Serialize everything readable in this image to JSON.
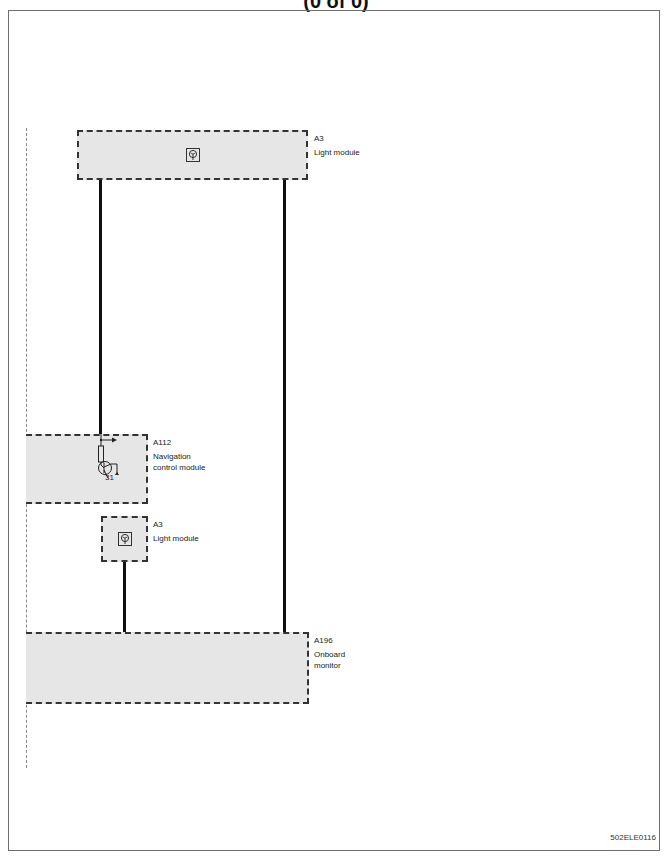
{
  "header": {
    "title": "(0 of 0)"
  },
  "modules": [
    {
      "id": "A3",
      "name": "Light module",
      "position": "top"
    },
    {
      "id": "A112",
      "name_line1": "Navigation",
      "name_line2": "control module",
      "pin": "31"
    },
    {
      "id": "A3",
      "name": "Light module",
      "position": "middle"
    },
    {
      "id": "A196",
      "name_line1": "Onboard",
      "name_line2": "monitor"
    }
  ],
  "icons": {
    "light_module": "light-bulb-icon",
    "transistor": "transistor-icon",
    "resistor": "resistor-icon",
    "arrow": "arrow-right-icon",
    "ground": "ground-icon"
  },
  "colors": {
    "module_fill": "#e6e6e6",
    "wire": "#111111",
    "dash": "#333333",
    "frame": "#6e6e6e"
  },
  "footer": {
    "doc_code": "502ELE0116"
  }
}
